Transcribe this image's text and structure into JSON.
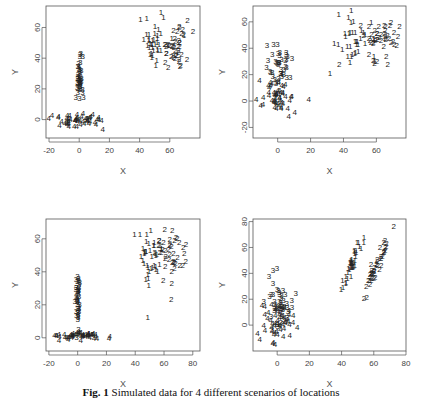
{
  "caption": {
    "label": "Fig. 1",
    "text": "Simulated data for 4 different scenarios of locations"
  },
  "chart_data": [
    {
      "type": "scatter",
      "panel": "top-left",
      "xlabel": "X",
      "ylabel": "Y",
      "xlim": [
        -22,
        80
      ],
      "ylim": [
        -12,
        74
      ],
      "xticks": [
        -20,
        0,
        20,
        40,
        60
      ],
      "yticks": [
        0,
        20,
        40,
        60
      ],
      "grid": false,
      "marker": "cluster-number-glyph",
      "px": {
        "x0": 46,
        "x1": 200,
        "y0": 6,
        "y1": 138
      },
      "series": [
        {
          "name": "1",
          "center": [
            50,
            50
          ],
          "spread": [
            5,
            8
          ],
          "n": 40
        },
        {
          "name": "2",
          "center": [
            63,
            45
          ],
          "spread": [
            5,
            8
          ],
          "n": 45
        },
        {
          "name": "3",
          "center": [
            0,
            25
          ],
          "spread": [
            1.2,
            8
          ],
          "n": 45
        },
        {
          "name": "4",
          "center": [
            0,
            -2
          ],
          "spread": [
            9,
            2.5
          ],
          "n": 55
        }
      ]
    },
    {
      "type": "scatter",
      "panel": "top-right",
      "xlabel": "X",
      "ylabel": "Y",
      "xlim": [
        -15,
        78
      ],
      "ylim": [
        -28,
        72
      ],
      "xticks": [
        0,
        20,
        40,
        60
      ],
      "yticks": [
        -20,
        0,
        20,
        40,
        60
      ],
      "grid": false,
      "marker": "cluster-number-glyph",
      "px": {
        "x0": 253,
        "x1": 406,
        "y0": 6,
        "y1": 138
      },
      "series": [
        {
          "name": "1",
          "center": [
            48,
            47
          ],
          "spread": [
            6,
            8
          ],
          "n": 40
        },
        {
          "name": "2",
          "center": [
            63,
            45
          ],
          "spread": [
            6,
            8
          ],
          "n": 45
        },
        {
          "name": "3",
          "center": [
            1,
            25
          ],
          "spread": [
            4,
            8
          ],
          "n": 45
        },
        {
          "name": "4",
          "center": [
            0,
            0
          ],
          "spread": [
            6,
            6
          ],
          "n": 55
        }
      ]
    },
    {
      "type": "scatter",
      "panel": "bottom-left",
      "xlabel": "X",
      "ylabel": "Y",
      "xlim": [
        -22,
        85
      ],
      "ylim": [
        -8,
        72
      ],
      "xticks": [
        -20,
        0,
        20,
        40,
        60,
        80
      ],
      "yticks": [
        0,
        20,
        40,
        60
      ],
      "grid": false,
      "marker": "cluster-number-glyph",
      "px": {
        "x0": 46,
        "x1": 200,
        "y0": 219,
        "y1": 351
      },
      "series": [
        {
          "name": "1",
          "center": [
            50,
            47
          ],
          "spread": [
            6,
            9
          ],
          "n": 40
        },
        {
          "name": "2",
          "center": [
            65,
            50
          ],
          "spread": [
            5,
            9
          ],
          "n": 45
        },
        {
          "name": "3",
          "center": [
            0,
            20
          ],
          "spread": [
            0.8,
            10
          ],
          "n": 45
        },
        {
          "name": "4",
          "center": [
            0,
            0
          ],
          "spread": [
            10,
            1.2
          ],
          "n": 55
        }
      ]
    },
    {
      "type": "scatter",
      "panel": "bottom-right",
      "xlabel": "X",
      "ylabel": "Y",
      "xlim": [
        -15,
        80
      ],
      "ylim": [
        -20,
        82
      ],
      "xticks": [
        0,
        20,
        40,
        60,
        80
      ],
      "yticks": [
        0,
        20,
        40,
        60,
        80
      ],
      "grid": false,
      "marker": "cluster-number-glyph",
      "px": {
        "x0": 253,
        "x1": 406,
        "y0": 219,
        "y1": 351
      },
      "series": [
        {
          "name": "1",
          "center": [
            47,
            47
          ],
          "spread": [
            3,
            9
          ],
          "corr": 0.9,
          "n": 40
        },
        {
          "name": "2",
          "center": [
            62,
            45
          ],
          "spread": [
            4,
            12
          ],
          "corr": 0.95,
          "n": 45
        },
        {
          "name": "3",
          "center": [
            1,
            18
          ],
          "spread": [
            4,
            10
          ],
          "n": 45
        },
        {
          "name": "4",
          "center": [
            0,
            0
          ],
          "spread": [
            5,
            8
          ],
          "n": 55
        }
      ]
    }
  ]
}
